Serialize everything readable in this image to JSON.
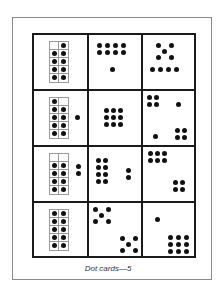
{
  "caption": "Dot cards—5",
  "grid": {
    "rows": 4,
    "cols": 3,
    "cells": [
      {
        "row": 0,
        "col": 0,
        "type": "ten-frame",
        "filled": [
          1,
          2,
          3,
          4,
          5,
          6,
          7,
          8,
          9
        ],
        "outside_dots": 0,
        "total": 9
      },
      {
        "row": 0,
        "col": 1,
        "type": "dots",
        "description": "2x4 block plus 1",
        "total": 9
      },
      {
        "row": 0,
        "col": 2,
        "type": "dots",
        "description": "dice five plus row of 4",
        "total": 9
      },
      {
        "row": 1,
        "col": 0,
        "type": "ten-frame",
        "filled": [
          0,
          2,
          3,
          4,
          5,
          6,
          7,
          8,
          9
        ],
        "outside_dots": 1,
        "total": 10
      },
      {
        "row": 1,
        "col": 1,
        "type": "dots",
        "description": "3x3 grid",
        "total": 9
      },
      {
        "row": 1,
        "col": 2,
        "type": "dots",
        "description": "2x2, single, single, 2x2",
        "total": 10
      },
      {
        "row": 2,
        "col": 0,
        "type": "ten-frame",
        "filled": [
          2,
          3,
          4,
          5,
          6,
          7,
          8,
          9
        ],
        "outside_dots": 2,
        "total": 10
      },
      {
        "row": 2,
        "col": 1,
        "type": "dots",
        "description": "2x4 block plus 2",
        "total": 10
      },
      {
        "row": 2,
        "col": 2,
        "type": "dots",
        "description": "2x3 block plus 2x2 block",
        "total": 10
      },
      {
        "row": 3,
        "col": 0,
        "type": "ten-frame",
        "filled": [
          0,
          1,
          2,
          3,
          4,
          5,
          6,
          7,
          8,
          9
        ],
        "outside_dots": 0,
        "total": 10
      },
      {
        "row": 3,
        "col": 1,
        "type": "dots",
        "description": "two dice fives",
        "total": 10
      },
      {
        "row": 3,
        "col": 2,
        "type": "dots",
        "description": "single plus 3x3",
        "total": 10
      }
    ]
  }
}
